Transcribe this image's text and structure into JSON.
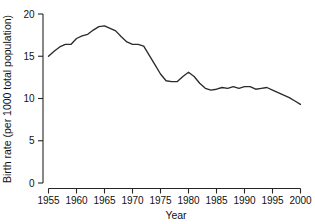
{
  "chart_data": {
    "type": "line",
    "title": "",
    "xlabel": "Year",
    "ylabel": "Birth rate (per 1000 total population)",
    "xlim": [
      1955,
      2000
    ],
    "ylim": [
      0,
      20
    ],
    "grid": false,
    "legend": null,
    "x_ticks": [
      1955,
      1960,
      1965,
      1970,
      1975,
      1980,
      1985,
      1990,
      1995,
      2000
    ],
    "x_tick_labels": [
      "1955",
      "1960",
      "1965",
      "1970",
      "1975",
      "1980",
      "1985",
      "1990",
      "1995",
      "2000"
    ],
    "y_ticks": [
      0,
      5,
      10,
      15,
      20
    ],
    "y_tick_labels": [
      "0",
      "5",
      "10",
      "15",
      "20"
    ],
    "line_color": "#2b2b2b",
    "series": [
      {
        "name": "Birth rate",
        "x": [
          1955,
          1956,
          1957,
          1958,
          1959,
          1960,
          1961,
          1962,
          1963,
          1964,
          1965,
          1966,
          1967,
          1968,
          1969,
          1970,
          1971,
          1972,
          1973,
          1974,
          1975,
          1976,
          1977,
          1978,
          1979,
          1980,
          1981,
          1982,
          1983,
          1984,
          1985,
          1986,
          1987,
          1988,
          1989,
          1990,
          1991,
          1992,
          1993,
          1994,
          1995,
          1996,
          1997,
          1998,
          1999,
          2000
        ],
        "values": [
          15.0,
          15.6,
          16.1,
          16.4,
          16.4,
          17.1,
          17.4,
          17.6,
          18.1,
          18.5,
          18.6,
          18.3,
          18.0,
          17.3,
          16.7,
          16.4,
          16.4,
          16.2,
          15.1,
          14.0,
          12.9,
          12.1,
          12.0,
          12.0,
          12.6,
          13.1,
          12.6,
          11.8,
          11.2,
          11.0,
          11.1,
          11.3,
          11.2,
          11.4,
          11.2,
          11.4,
          11.4,
          11.1,
          11.2,
          11.3,
          11.0,
          10.7,
          10.4,
          10.1,
          9.7,
          9.3
        ]
      }
    ]
  },
  "axis_labels": {
    "x_title": "Year",
    "y_title": "Birth rate (per 1000 total population)"
  }
}
